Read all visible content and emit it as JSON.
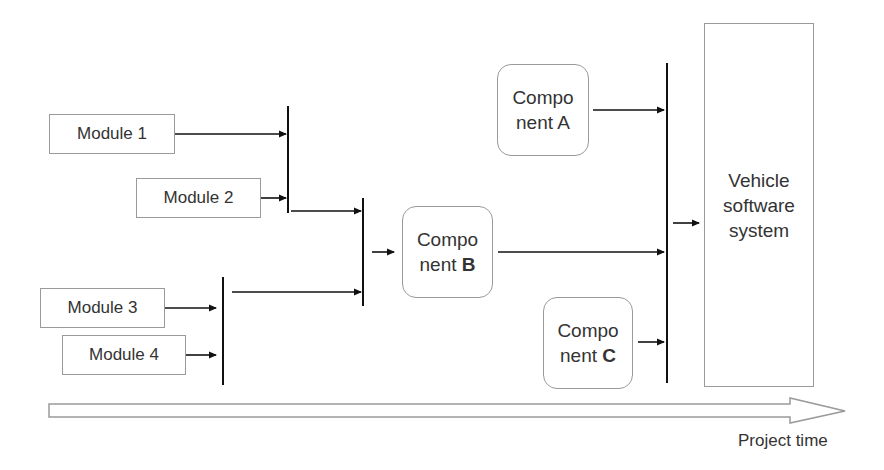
{
  "modules": [
    {
      "label": "Module 1"
    },
    {
      "label": "Module 2"
    },
    {
      "label": "Module 3"
    },
    {
      "label": "Module 4"
    }
  ],
  "components": [
    {
      "line1": "Compo",
      "line2_prefix": "nent ",
      "letter": "A"
    },
    {
      "line1": "Compo",
      "line2_prefix": "nent ",
      "letter": "B"
    },
    {
      "line1": "Compo",
      "line2_prefix": "nent ",
      "letter": "C"
    }
  ],
  "system": {
    "lines": [
      "Vehicle",
      "software",
      "system"
    ]
  },
  "timeline": {
    "label": "Project time"
  },
  "colors": {
    "line": "#111111",
    "box_border": "#9a9a9a",
    "text": "#333333"
  }
}
